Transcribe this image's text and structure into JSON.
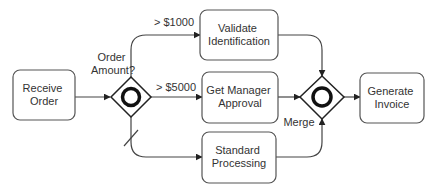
{
  "diagram": {
    "type": "BPMN process",
    "colors": {
      "stroke": "#333333",
      "fill": "#ffffff",
      "text": "#333333"
    },
    "tasks": [
      {
        "id": "receive-order",
        "lines": [
          "Receive",
          "Order"
        ]
      },
      {
        "id": "validate-identification",
        "lines": [
          "Validate",
          "Identification"
        ]
      },
      {
        "id": "get-manager-approval",
        "lines": [
          "Get Manager",
          "Approval"
        ]
      },
      {
        "id": "standard-processing",
        "lines": [
          "Standard",
          "Processing"
        ]
      },
      {
        "id": "generate-invoice",
        "lines": [
          "Generate",
          "Invoice"
        ]
      }
    ],
    "gateways": [
      {
        "id": "split-gateway",
        "kind": "inclusive",
        "label_lines": [
          "Order",
          "Amount?"
        ]
      },
      {
        "id": "merge-gateway",
        "kind": "inclusive",
        "label_lines": [
          "Merge"
        ]
      }
    ],
    "flows": [
      {
        "from": "receive-order",
        "to": "split-gateway",
        "label": ""
      },
      {
        "from": "split-gateway",
        "to": "validate-identification",
        "label": "> $1000"
      },
      {
        "from": "split-gateway",
        "to": "get-manager-approval",
        "label": "> $5000"
      },
      {
        "from": "split-gateway",
        "to": "standard-processing",
        "label": "",
        "default": true
      },
      {
        "from": "validate-identification",
        "to": "merge-gateway",
        "label": ""
      },
      {
        "from": "get-manager-approval",
        "to": "merge-gateway",
        "label": ""
      },
      {
        "from": "standard-processing",
        "to": "merge-gateway",
        "label": ""
      },
      {
        "from": "merge-gateway",
        "to": "generate-invoice",
        "label": ""
      }
    ]
  }
}
